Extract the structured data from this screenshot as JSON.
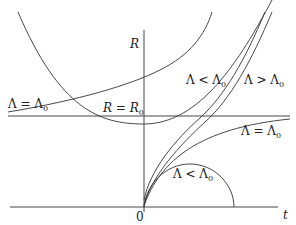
{
  "figure": {
    "type": "diagram",
    "axes": {
      "vertical_label": "R",
      "horizontal_label": "t",
      "origin_label": "0"
    },
    "reference_line": {
      "label": "R = R₀",
      "label_main": "R = R",
      "label_sub": "0"
    },
    "curve_labels": [
      {
        "id": "left-equal",
        "main": "Λ = Λ",
        "sub": "0"
      },
      {
        "id": "upper-less",
        "main": "Λ < Λ",
        "sub": "0"
      },
      {
        "id": "upper-greater",
        "main": "Λ > Λ",
        "sub": "0"
      },
      {
        "id": "right-equal",
        "main": "Λ = Λ",
        "sub": "0"
      },
      {
        "id": "lower-less",
        "main": "Λ < Λ",
        "sub": "0"
      }
    ],
    "stroke_color": "#333333"
  }
}
